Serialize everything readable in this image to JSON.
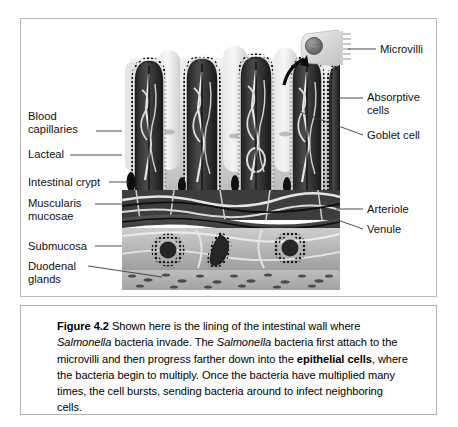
{
  "figure": {
    "id": "Figure 4.2",
    "caption_parts": [
      {
        "text": "Figure 4.2",
        "style": "bold"
      },
      {
        "text": "  Shown here is the lining of the intestinal wall where ",
        "style": "normal"
      },
      {
        "text": "Salmonella",
        "style": "italic"
      },
      {
        "text": " bacteria invade. The ",
        "style": "normal"
      },
      {
        "text": "Salmonella",
        "style": "italic"
      },
      {
        "text": " bacteria first attach to the microvilli and then progress farther down into the ",
        "style": "normal"
      },
      {
        "text": "epithelial cells",
        "style": "bold"
      },
      {
        "text": ", where the bacteria begin to multiply. Once the bacteria have multiplied many times, the cell bursts, sending bacteria around to infect neighboring cells.",
        "style": "normal"
      }
    ],
    "caption_plain": "Figure 4.2  Shown here is the lining of the intestinal wall where Salmonella bacteria invade. The Salmonella bacteria first attach to the microvilli and then progress farther down into the epithelial cells, where the bacteria begin to multiply. Once the bacteria have multiplied many times, the cell bursts, sending bacteria around to infect neighboring cells."
  },
  "labels_left": [
    {
      "key": "blood-capillaries",
      "text": "Blood\ncapillaries",
      "x": 28,
      "y": 111,
      "lead_from_x": 96,
      "lead_from_y": 131,
      "lead_to_x": 122,
      "lead_to_y": 131
    },
    {
      "key": "lacteal",
      "text": "Lacteal",
      "x": 28,
      "y": 149,
      "lead_from_x": 70,
      "lead_from_y": 155,
      "lead_to_x": 122,
      "lead_to_y": 155
    },
    {
      "key": "intestinal-crypt",
      "text": "Intestinal crypt",
      "x": 28,
      "y": 176,
      "lead_from_x": 107,
      "lead_from_y": 182,
      "lead_to_x": 128,
      "lead_to_y": 182
    },
    {
      "key": "muscularis-mucosae",
      "text": "Muscularis\nmucosae",
      "x": 28,
      "y": 198,
      "lead_from_x": 93,
      "lead_from_y": 204,
      "lead_to_x": 122,
      "lead_to_y": 204
    },
    {
      "key": "submucosa",
      "text": "Submucosa",
      "x": 28,
      "y": 240,
      "lead_from_x": 93,
      "lead_from_y": 246,
      "lead_to_x": 122,
      "lead_to_y": 246
    },
    {
      "key": "duodenal-glands",
      "text": "Duodenal\nglands",
      "x": 28,
      "y": 261,
      "lead_from_x": 88,
      "lead_from_y": 266,
      "lead_to_x": 160,
      "lead_to_y": 276
    }
  ],
  "labels_right": [
    {
      "key": "microvilli",
      "text": "Microvilli",
      "x": 380,
      "y": 43,
      "lead_from_x": 343,
      "lead_from_y": 49,
      "lead_to_x": 375,
      "lead_to_y": 49
    },
    {
      "key": "absorptive-cells",
      "text": "Absorptive\ncells",
      "x": 367,
      "y": 92,
      "lead_from_x": 316,
      "lead_from_y": 98,
      "lead_to_x": 362,
      "lead_to_y": 98
    },
    {
      "key": "goblet-cell",
      "text": "Goblet cell",
      "x": 367,
      "y": 130,
      "lead_from_x": 305,
      "lead_from_y": 113,
      "lead_to_x": 362,
      "lead_to_y": 136
    },
    {
      "key": "arteriole",
      "text": "Arteriole",
      "x": 367,
      "y": 203,
      "lead_from_x": 340,
      "lead_from_y": 209,
      "lead_to_x": 362,
      "lead_to_y": 209
    },
    {
      "key": "venule",
      "text": "Venule",
      "x": 367,
      "y": 223,
      "lead_from_x": 336,
      "lead_from_y": 219,
      "lead_to_x": 362,
      "lead_to_y": 229
    }
  ],
  "illustration": {
    "type": "grayscale anatomical cross-section",
    "layers": [
      {
        "name": "villi",
        "description": "finger-like projections with dotted epithelial border"
      },
      {
        "name": "lamina propria",
        "description": "dark core with pale vessels"
      },
      {
        "name": "muscularis mucosae",
        "description": "dark horizontal band"
      },
      {
        "name": "submucosa",
        "description": "pale band containing duodenal glands"
      },
      {
        "name": "muscle layer",
        "description": "speckled band at bottom"
      }
    ],
    "villi_count": 5,
    "background_villi_count": 3,
    "gland_count": 3,
    "inset": {
      "name": "microvilli-inset",
      "description": "absorptive cell with nucleus and brush border"
    }
  },
  "colors": {
    "frame": "#b8b8b8",
    "caption_border": "#b0b0b0",
    "text": "#111111",
    "leader": "#3a3a3a",
    "page_bg": "#ffffff",
    "art_dark": "#2b2b2b",
    "art_mid": "#8d8d8d",
    "art_light": "#d9d9d9"
  }
}
